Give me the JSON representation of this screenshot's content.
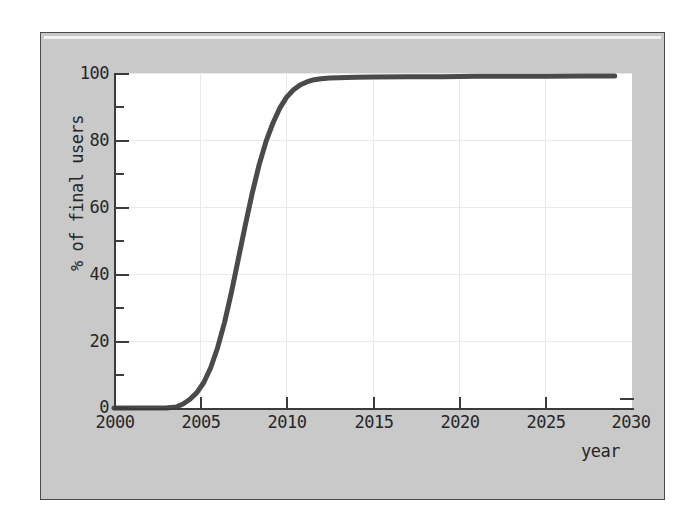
{
  "figure": {
    "background_color": "#c9c9c9",
    "plot_background_color": "#ffffff",
    "axis_color": "#3b3b3b",
    "grid_color": "#e9e9e9",
    "curve_color": "#4a4a4a"
  },
  "chart_data": {
    "type": "line",
    "title": "",
    "xlabel": "year",
    "ylabel": "% of final users",
    "xlim": [
      2000,
      2030
    ],
    "ylim": [
      0,
      100
    ],
    "grid": true,
    "legend": null,
    "x_ticks": [
      2000,
      2005,
      2010,
      2015,
      2020,
      2025,
      2030
    ],
    "x_tick_labels": [
      "2000",
      "2005",
      "2010",
      "2015",
      "2020",
      "2025",
      "2030"
    ],
    "x_minor_ticks": [
      2002.5,
      2007.5,
      2012.5,
      2017.5,
      2022.5,
      2027.5
    ],
    "y_ticks": [
      0,
      20,
      40,
      60,
      80,
      100
    ],
    "y_tick_labels": [
      "0",
      "20",
      "40",
      "60",
      "80",
      "100"
    ],
    "y_minor_ticks": [
      10,
      30,
      50,
      70,
      90
    ],
    "series": [
      {
        "name": "adoption",
        "x": [
          2000,
          2001,
          2002,
          2003,
          2003.6,
          2004,
          2004.4,
          2004.8,
          2005.2,
          2005.6,
          2006,
          2006.4,
          2006.8,
          2007.2,
          2007.6,
          2008,
          2008.4,
          2008.8,
          2009.2,
          2009.6,
          2010,
          2010.4,
          2010.8,
          2011.2,
          2011.6,
          2012,
          2012.5,
          2013,
          2014,
          2015,
          2017,
          2019,
          2021,
          2023,
          2025,
          2027,
          2029
        ],
        "y": [
          0,
          0,
          0,
          0,
          0.3,
          1.2,
          2.6,
          4.6,
          7.6,
          12.0,
          18.0,
          25.5,
          34.5,
          44.5,
          54.5,
          64.0,
          72.5,
          79.5,
          85.0,
          89.5,
          92.8,
          95.0,
          96.5,
          97.4,
          98.0,
          98.3,
          98.5,
          98.6,
          98.7,
          98.8,
          98.9,
          98.9,
          99.0,
          99.0,
          99.0,
          99.1,
          99.1
        ]
      }
    ]
  }
}
